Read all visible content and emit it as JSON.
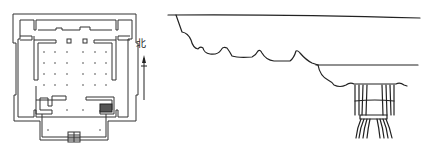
{
  "figure": {
    "floor_plan": {
      "north_label": "北",
      "column_grid": {
        "rows": 4,
        "cols_left": 3,
        "cols_right": 3
      }
    },
    "elevation": {
      "description": "bracket / capital elevation drawing"
    },
    "colors": {
      "line": "#222222",
      "background": "#ffffff"
    }
  }
}
